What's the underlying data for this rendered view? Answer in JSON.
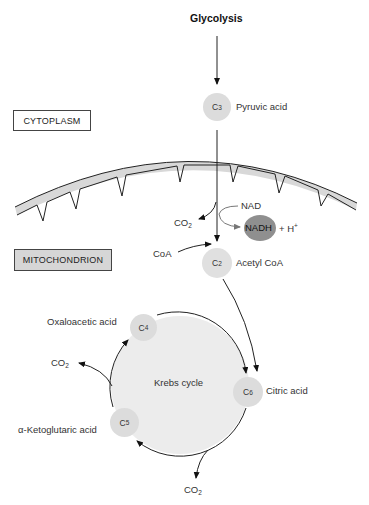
{
  "title": "Glycolysis",
  "regions": {
    "cytoplasm": "CYTOPLASM",
    "mitochondrion": "MITOCHONDRION"
  },
  "nodes": {
    "c3": {
      "label": "C",
      "sub": "3",
      "name": "Pyruvic acid"
    },
    "c2": {
      "label": "C",
      "sub": "2",
      "name": "Acetyl CoA"
    },
    "c4": {
      "label": "C",
      "sub": "4",
      "name": "Oxaloacetic acid"
    },
    "c6": {
      "label": "C",
      "sub": "6",
      "name": "Citric acid"
    },
    "c5": {
      "label": "C",
      "sub": "5",
      "name": "α-Ketoglutaric acid"
    }
  },
  "cycle": {
    "label": "Krebs cycle"
  },
  "reactants": {
    "nad": "NAD",
    "nadh": "NADH",
    "plus_h": "+ H",
    "h_sup": "+",
    "coa": "CoA",
    "co2": "CO",
    "co2_sub": "2"
  },
  "colors": {
    "node_fill": "#dcdcdc",
    "cycle_fill": "#ececec",
    "nadh_fill": "#8f8f8f",
    "membrane_fill": "#d8d8d8",
    "mito_box_fill": "#d6d6d6",
    "line": "#222222"
  }
}
